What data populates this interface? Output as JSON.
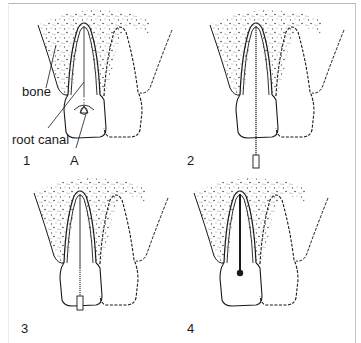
{
  "figure": {
    "panels": [
      {
        "number": "1",
        "stage": "access cavity opened at A, root canal located"
      },
      {
        "number": "2",
        "stage": "instrument inserted into root canal"
      },
      {
        "number": "3",
        "stage": "canal filled, instrument at crown"
      },
      {
        "number": "4",
        "stage": "root canal filled and sealed"
      }
    ],
    "labels": {
      "bone": "bone",
      "root_canal": "root canal",
      "access_point": "A"
    },
    "colors": {
      "line": "#1a1a1a",
      "stipple": "#555555",
      "frame": "#b8b8b8"
    }
  }
}
